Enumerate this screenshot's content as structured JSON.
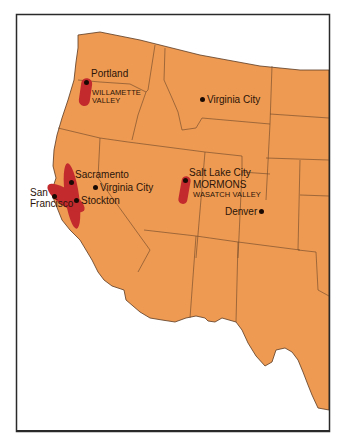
{
  "map": {
    "title": "",
    "colors": {
      "land": "#EE9A52",
      "settlement_region": "#C22A2E",
      "border": "#5A3A22",
      "frame": "#2A2A2A",
      "background": "#FFFFFF",
      "text": "#2B1408"
    },
    "cities": [
      {
        "name": "Portland",
        "x": 87,
        "y": 82
      },
      {
        "name": "Virginia City",
        "x": 203,
        "y": 99,
        "note": "Montana"
      },
      {
        "name": "Sacramento",
        "x": 71,
        "y": 183
      },
      {
        "name": "San Francisco",
        "x": 55,
        "y": 196
      },
      {
        "name": "Stockton",
        "x": 76,
        "y": 201
      },
      {
        "name": "Virginia City",
        "x": 95,
        "y": 188,
        "note": "Nevada"
      },
      {
        "name": "Salt Lake City",
        "x": 186,
        "y": 181
      },
      {
        "name": "Denver",
        "x": 262,
        "y": 211
      }
    ],
    "labels": {
      "portland": "Portland",
      "willamette_line1": "WILLAMETTE",
      "willamette_line2": "VALLEY",
      "virginia_city_mt": "Virginia City",
      "sacramento": "Sacramento",
      "san_line1": "San",
      "san_line2": "Francisco",
      "stockton": "Stockton",
      "virginia_city_nv": "Virginia City",
      "salt_lake_city": "Salt Lake City",
      "mormons": "MORMONS",
      "wasatch": "WASATCH VALLEY",
      "denver": "Denver"
    },
    "regions": [
      {
        "name": "Willamette Valley"
      },
      {
        "name": "Sacramento–San Joaquin (California gold region)"
      },
      {
        "name": "Wasatch Valley"
      }
    ]
  }
}
